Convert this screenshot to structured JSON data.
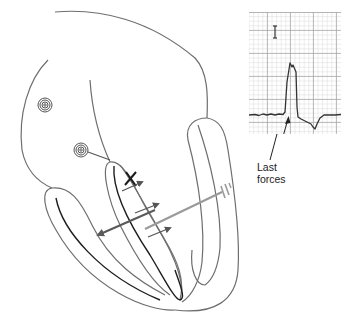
{
  "diagram": {
    "colors": {
      "outline": "#6e6e6e",
      "endocardium_dark": "#1e1e1e",
      "vector_dark": "#5a5a5a",
      "vector_light": "#9a9a9a",
      "grid_minor": "#d6d6d6",
      "grid_major": "#9f9f9f",
      "trace": "#333333"
    },
    "elements": {
      "sa_node": "SA node spiral",
      "av_node": "AV node spiral",
      "conduction_marker": "X",
      "septal_vectors": "short arrows across septum",
      "main_vector": "dark double-headed arrow toward left ventricle",
      "terminal_vector": "light gray arrow toward right ventricle wall"
    }
  },
  "ecg": {
    "calibration_mark": "I",
    "annotation": {
      "line1": "Last",
      "line2": "forces"
    }
  }
}
